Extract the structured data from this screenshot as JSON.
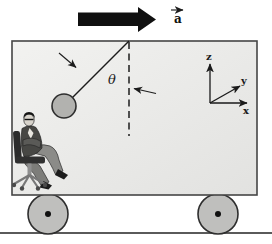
{
  "figure": {
    "acceleration_label": "a",
    "angle_label": "θ",
    "axes": {
      "x": "x",
      "y": "y",
      "z": "z"
    },
    "colors": {
      "cart_fill_light": "#f2f2f0",
      "cart_fill_dark": "#e2e2e0",
      "cart_border": "#454545",
      "wheel_fill": "#bfbfbd",
      "wheel_border": "#2e2e2e",
      "wheel_hub": "#111111",
      "bob_fill": "#b2b2af",
      "bob_border": "#2e2e2e",
      "black_arrow": "#101010",
      "line_color": "#1c1c1c",
      "ground_color": "#5a5a5a"
    }
  }
}
